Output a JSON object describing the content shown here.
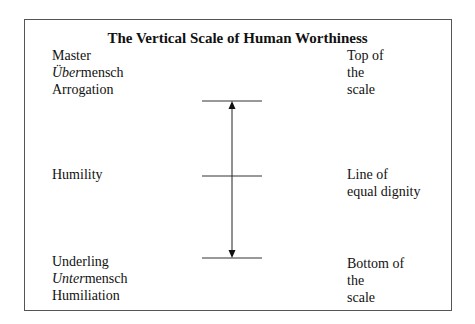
{
  "title": "The Vertical Scale of Human Worthiness",
  "left_labels": {
    "top": [
      {
        "italic": "",
        "text": "Master"
      },
      {
        "italic": "Über",
        "text": "mensch"
      },
      {
        "italic": "",
        "text": "Arrogation"
      }
    ],
    "middle": [
      {
        "italic": "",
        "text": "Humility"
      }
    ],
    "bottom": [
      {
        "italic": "",
        "text": "Underling"
      },
      {
        "italic": "Unter",
        "text": "mensch"
      },
      {
        "italic": "",
        "text": "Humiliation"
      }
    ]
  },
  "right_labels": {
    "top": [
      "Top of",
      "the",
      "scale"
    ],
    "middle": [
      "Line of",
      "equal dignity"
    ],
    "bottom": [
      "Bottom of",
      "the",
      "scale"
    ]
  },
  "scale": {
    "levels": [
      "top",
      "middle",
      "bottom"
    ],
    "arrow": "double-headed vertical"
  }
}
